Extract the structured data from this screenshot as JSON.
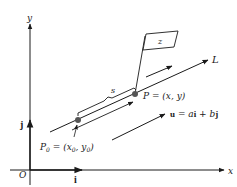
{
  "diagram": {
    "axes": {
      "x_label": "x",
      "y_label": "y",
      "origin_label": "O"
    },
    "unit_vectors": {
      "i_label": "i",
      "j_label": "j"
    },
    "line": {
      "label": "L"
    },
    "points": {
      "p0_name": "P",
      "p0_sub": "0",
      "p0_eq": " = (x",
      "p0_x_sub": "0",
      "p0_comma": ", y",
      "p0_y_sub": "0",
      "p0_close": ")",
      "p_label": "P = (x, y)"
    },
    "arc_length_label": "s",
    "flag_label": "z",
    "vector_u": {
      "u": "u",
      "eq": " = ",
      "a": "a",
      "i": "i",
      "plus": " + ",
      "b": "b",
      "j": "j"
    },
    "colors": {
      "stroke": "#1a1a1a",
      "point_fill": "#555555",
      "background": "#ffffff"
    }
  }
}
